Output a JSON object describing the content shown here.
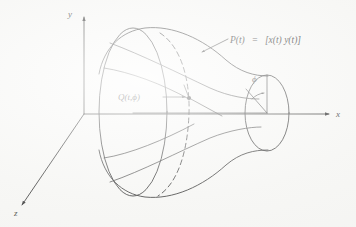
{
  "figure": {
    "background_color": "#f7f7f5",
    "ink_color": "#1b1b1b",
    "width": 356,
    "height": 227
  },
  "axes": {
    "y_label": "y",
    "x_label": "x",
    "z_label": "z",
    "origin_label": "",
    "y_axis_name": "vertical axis",
    "x_axis_name": "horizontal axis of revolution",
    "z_axis_name": "depth axis"
  },
  "annotations": {
    "curve_label": {
      "name": "generating-curve-label",
      "lhs": "P(t)",
      "equals": "=",
      "rhs": "[x(t) y(t)]",
      "full": "P(t) = [x(t) y(t)]"
    },
    "point_label": {
      "name": "surface-point-label",
      "full": "Q(t,ϕ)",
      "q": "Q",
      "open": "(",
      "param_t": "t",
      "comma": ",",
      "param_phi": "ϕ",
      "close": ")"
    },
    "angle_label": {
      "name": "rotation-angle-label",
      "symbol": "ϕ"
    }
  },
  "geometry": {
    "left_circle_name": "large-end-circle",
    "right_circle_name": "small-end-circle",
    "waist_circle_name": "hidden-waist-circle-dashed",
    "profile_name": "hyperboloid-profile-curve",
    "ruling_name": "surface-ruling-line"
  }
}
